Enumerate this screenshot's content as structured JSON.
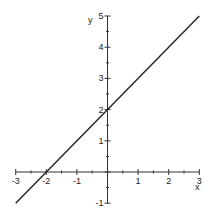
{
  "chart_data": {
    "type": "line",
    "title": "",
    "xlabel": "x",
    "ylabel": "y",
    "xlim": [
      -3,
      3
    ],
    "ylim": [
      -1,
      5
    ],
    "x_ticks": [
      -3,
      -2,
      -1,
      1,
      2,
      3
    ],
    "y_ticks": [
      -1,
      1,
      2,
      3,
      4,
      5
    ],
    "x_tick_labels": [
      "-3",
      "-2",
      "-1",
      "1",
      "2",
      "3"
    ],
    "y_tick_labels": [
      "-1",
      "1",
      "2",
      "3",
      "4",
      "5"
    ],
    "minor_ticks": 0.5,
    "grid": false,
    "series": [
      {
        "name": "y = x + 2",
        "x": [
          -3,
          3
        ],
        "y": [
          -1,
          5
        ],
        "color": "#222222"
      }
    ]
  }
}
